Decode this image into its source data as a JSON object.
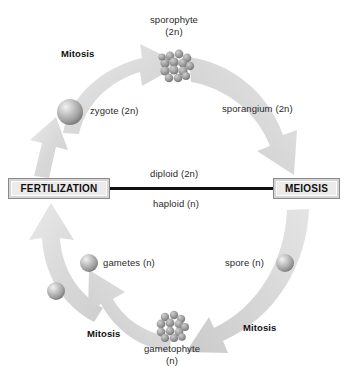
{
  "diagram": {
    "background_color": "#ffffff",
    "arrow_color": "#dcdcdc",
    "axis_line_color": "#111111"
  },
  "process_boxes": [
    {
      "id": "fertilization",
      "label": "FERTILIZATION",
      "x": 8,
      "y": 178,
      "w": 102,
      "h": 21
    },
    {
      "id": "meiosis",
      "label": "MEIOSIS",
      "x": 273,
      "y": 178,
      "w": 67,
      "h": 21
    }
  ],
  "axis": {
    "diploid_label": "diploid (2n)",
    "haploid_label": "haploid (n)",
    "line_x1": 110,
    "line_x2": 273,
    "line_y": 188
  },
  "stage_labels": [
    {
      "id": "sporophyte",
      "line1": "sporophyte",
      "line2": "(2n)",
      "x": 150,
      "y": 14
    },
    {
      "id": "sporangium",
      "line1": "sporangium (2n)",
      "line2": "",
      "x": 222,
      "y": 103
    },
    {
      "id": "zygote",
      "line1": "zygote (2n)",
      "line2": "",
      "x": 90,
      "y": 105
    },
    {
      "id": "gametes",
      "line1": "gametes (n)",
      "line2": "",
      "x": 95,
      "y": 259
    },
    {
      "id": "spore",
      "line1": "spore (n)",
      "line2": "",
      "x": 229,
      "y": 259
    },
    {
      "id": "gametophyte",
      "line1": "gametophyte",
      "line2": "(n)",
      "x": 144,
      "y": 341
    }
  ],
  "mitosis_labels": [
    {
      "id": "mitosis-top-left",
      "label": "Mitosis",
      "x": 61,
      "y": 48
    },
    {
      "id": "mitosis-bottom-left",
      "label": "Mitosis",
      "x": 87,
      "y": 328
    },
    {
      "id": "mitosis-bottom-right",
      "label": "Mitosis",
      "x": 243,
      "y": 322
    }
  ],
  "cell_clusters": [
    {
      "id": "sporophyte-cluster",
      "cx": 178,
      "cy": 65,
      "r": 17
    },
    {
      "id": "gametophyte-cluster",
      "cx": 172,
      "cy": 327,
      "r": 16
    }
  ],
  "spheres": [
    {
      "id": "zygote-sphere",
      "cx": 70,
      "cy": 112,
      "r": 13
    },
    {
      "id": "gamete-sphere-upper",
      "cx": 89,
      "cy": 263,
      "r": 9
    },
    {
      "id": "gamete-sphere-lower",
      "cx": 56,
      "cy": 291,
      "r": 9
    },
    {
      "id": "spore-sphere",
      "cx": 285,
      "cy": 263,
      "r": 9
    }
  ],
  "arrows": [
    {
      "id": "mitosis-arrow-zygote-to-sporophyte",
      "from": "zygote (2n)",
      "to": "sporophyte (2n)",
      "direction": "clockwise"
    },
    {
      "id": "meiosis-arrow-sporophyte-to-meiosis",
      "from": "sporangium (2n)",
      "to": "MEIOSIS",
      "direction": "clockwise"
    },
    {
      "id": "mitosis-arrow-spore-to-gametophyte",
      "from": "spore (n)",
      "to": "gametophyte (n)",
      "direction": "clockwise"
    },
    {
      "id": "mitosis-arrow-gametophyte-to-gametes",
      "from": "gametophyte (n)",
      "to": "gametes (n)",
      "direction": "clockwise"
    },
    {
      "id": "fertilization-arrow-gametes-to-fertilization",
      "from": "gametes (n)",
      "to": "FERTILIZATION",
      "direction": "clockwise"
    },
    {
      "id": "arrow-fertilization-to-zygote",
      "from": "FERTILIZATION",
      "to": "zygote (2n)",
      "direction": "clockwise"
    }
  ]
}
